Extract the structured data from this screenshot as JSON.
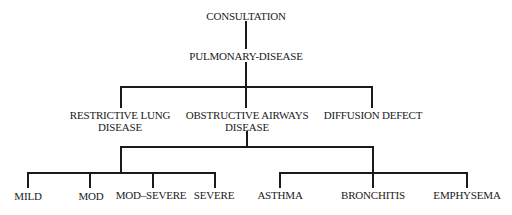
{
  "diagram": {
    "type": "tree",
    "root": {
      "label": "CONSULTATION",
      "child": {
        "label": "PULMONARY-DISEASE",
        "children": [
          {
            "lines": [
              "RESTRICTIVE LUNG",
              "DISEASE"
            ]
          },
          {
            "lines": [
              "OBSTRUCTIVE AIRWAYS",
              "DISEASE"
            ],
            "severity_group": [
              "MILD",
              "MOD",
              "MOD–SEVERE",
              "SEVERE"
            ],
            "type_group": [
              "ASTHMA",
              "BRONCHITIS",
              "EMPHYSEMA"
            ]
          },
          {
            "lines": [
              "DIFFUSION DEFECT"
            ]
          }
        ]
      }
    }
  }
}
